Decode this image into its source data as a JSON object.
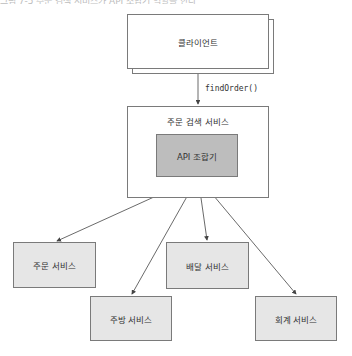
{
  "figure": {
    "top_text": "그림 7-5 주문 검색 서비스가 API 조합기 역할을 한다"
  },
  "diagram": {
    "client": {
      "label": "클라이언트"
    },
    "call": {
      "label": "findOrder()"
    },
    "order_query_service": {
      "label": "주문 검색 서비스"
    },
    "api_composer": {
      "label": "API 조합기"
    },
    "services": [
      {
        "label": "주문 서비스"
      },
      {
        "label": "주방 서비스"
      },
      {
        "label": "배달 서비스"
      },
      {
        "label": "회계 서비스"
      }
    ],
    "colors": {
      "border": "#7a7a7a",
      "service_fill": "#e6e6e6",
      "composer_fill": "#bdbdbd",
      "arrow": "#444444"
    }
  }
}
